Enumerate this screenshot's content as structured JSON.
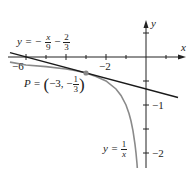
{
  "diagram": {
    "type": "function-graph",
    "axes": {
      "x_label": "x",
      "y_label": "y",
      "x_tick_labels": [
        {
          "value": -6,
          "text": "−6"
        },
        {
          "value": -2,
          "text": "−2"
        }
      ],
      "y_tick_labels": [
        {
          "value": -1,
          "text": "−1"
        },
        {
          "value": -2,
          "text": "−2"
        }
      ],
      "x_ticks": [
        -6,
        -5,
        -4,
        -3,
        -2,
        -1,
        1
      ],
      "y_ticks": [
        0.5,
        -0.5,
        -1,
        -1.5,
        -2
      ]
    },
    "tangent_line": {
      "label_prefix": "y = −",
      "label_frac1_num": "x",
      "label_frac1_den": "9",
      "label_mid": " − ",
      "label_frac2_num": "2",
      "label_frac2_den": "3",
      "equation": "y = -x/9 - 2/3",
      "color": "#1a1a1a"
    },
    "curve": {
      "label_prefix": "y = ",
      "label_frac_num": "1",
      "label_frac_den": "x",
      "equation": "y = 1/x",
      "color": "#8a8a8a"
    },
    "point": {
      "label_prefix": "P = ",
      "label_open": "(",
      "label_coords": "−3, −",
      "label_frac_num": "1",
      "label_frac_den": "3",
      "label_close": ")",
      "x": -3,
      "y": -0.3333,
      "color": "#888888"
    }
  }
}
